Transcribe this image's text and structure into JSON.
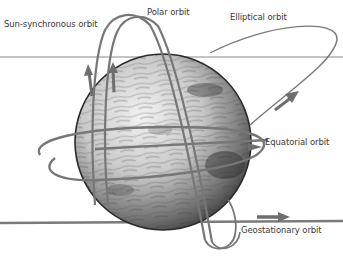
{
  "diagram": {
    "labels": {
      "sun_synchronous": "Sun-synchronous orbit",
      "polar": "Polar orbit",
      "elliptical": "Elliptical orbit",
      "equatorial": "Equatorial orbit",
      "geostationary": "Geostationary orbit"
    },
    "colors": {
      "orbit_line": "#7a7a7a",
      "arrow": "#6e6e6e",
      "globe_dark": "#2e2e2e",
      "globe_light": "#e8e8e8",
      "label_text": "#3a3a3a",
      "background": "#ffffff"
    },
    "arrows": [
      {
        "orbit": "sun_synchronous",
        "direction": "up"
      },
      {
        "orbit": "polar",
        "direction": "up"
      },
      {
        "orbit": "elliptical",
        "direction": "up-right"
      },
      {
        "orbit": "geostationary",
        "direction": "right"
      }
    ]
  }
}
